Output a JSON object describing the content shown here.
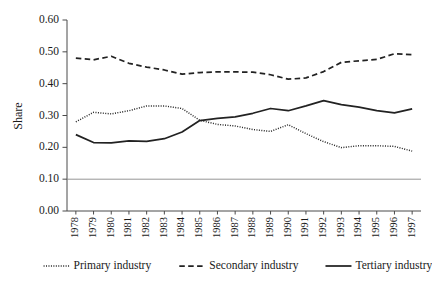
{
  "chart_data": {
    "type": "line",
    "title": "",
    "xlabel": "",
    "ylabel": "Share",
    "ylim": [
      0.0,
      0.6
    ],
    "yticks": [
      "0.00",
      "0.10",
      "0.20",
      "0.30",
      "0.40",
      "0.50",
      "0.60"
    ],
    "ytick_values": [
      0.0,
      0.1,
      0.2,
      0.3,
      0.4,
      0.5,
      0.6
    ],
    "grid": false,
    "reference_line": 0.1,
    "legend_position": "bottom",
    "categories": [
      "1978",
      "1979",
      "1980",
      "1981",
      "1982",
      "1983",
      "1984",
      "1985",
      "1986",
      "1987",
      "1988",
      "1989",
      "1990",
      "1991",
      "1992",
      "1993",
      "1994",
      "1995",
      "1996",
      "1997"
    ],
    "x": [
      1978,
      1979,
      1980,
      1981,
      1982,
      1983,
      1984,
      1985,
      1986,
      1987,
      1988,
      1989,
      1990,
      1991,
      1992,
      1993,
      1994,
      1995,
      1996,
      1997
    ],
    "series": [
      {
        "name": "Primary industry",
        "style": "dotted",
        "values": [
          0.28,
          0.31,
          0.305,
          0.315,
          0.33,
          0.33,
          0.322,
          0.285,
          0.272,
          0.267,
          0.256,
          0.25,
          0.271,
          0.243,
          0.218,
          0.199,
          0.205,
          0.205,
          0.203,
          0.188
        ]
      },
      {
        "name": "Secondary industry",
        "style": "dashed",
        "values": [
          0.48,
          0.475,
          0.486,
          0.464,
          0.452,
          0.443,
          0.43,
          0.435,
          0.437,
          0.437,
          0.436,
          0.428,
          0.414,
          0.418,
          0.438,
          0.467,
          0.472,
          0.476,
          0.494,
          0.491
        ]
      },
      {
        "name": "Tertiary industry",
        "style": "solid",
        "values": [
          0.24,
          0.215,
          0.214,
          0.22,
          0.219,
          0.227,
          0.248,
          0.284,
          0.291,
          0.296,
          0.307,
          0.322,
          0.315,
          0.33,
          0.347,
          0.334,
          0.326,
          0.315,
          0.308,
          0.321
        ]
      }
    ]
  },
  "legend": {
    "items": [
      {
        "label": "Primary industry",
        "style": "dotted"
      },
      {
        "label": "Secondary industry",
        "style": "dashed"
      },
      {
        "label": "Tertiary industry",
        "style": "solid"
      }
    ]
  },
  "colors": {
    "line": "#222222",
    "axis": "#4a4a4a",
    "reference": "#8a8a8a",
    "background": "#ffffff"
  }
}
